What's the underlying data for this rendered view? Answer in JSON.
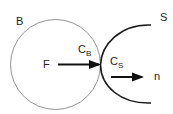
{
  "labels": {
    "body_b": "B",
    "body_s": "S",
    "point_f": "F",
    "contact_b_main": "C",
    "contact_b_sub": "B",
    "contact_s_main": "C",
    "contact_s_sub": "S",
    "normal_n": "n"
  },
  "colors": {
    "circle_stroke": "#777777",
    "curve_stroke": "#1a1a1a",
    "arrow": "#111111",
    "text": "#222222"
  }
}
